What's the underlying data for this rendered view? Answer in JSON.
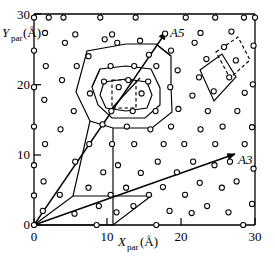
{
  "figure": {
    "title": "",
    "x_axis_label_main": "X",
    "x_axis_label_sub": "par",
    "x_axis_label_unit": "(Å)",
    "y_axis_label_main": "Y",
    "y_axis_label_sub": "par",
    "y_axis_label_unit": "(Å)",
    "origin_label": "0",
    "annotations": [
      {
        "name": "A5",
        "label": "A5"
      },
      {
        "name": "A3",
        "label": "A3"
      }
    ],
    "colors": {
      "line": "#000000",
      "marker_stroke": "#000000",
      "marker_fill": "#ffffff",
      "background": "#ffffff"
    }
  },
  "chart_data": {
    "type": "scatter",
    "title": "",
    "xlabel": "X_par (Å)",
    "ylabel": "Y_par (Å)",
    "xlim": [
      0,
      31.2
    ],
    "ylim": [
      0,
      31.6
    ],
    "grid": false,
    "legend": null,
    "xticks": [
      0,
      10,
      20,
      30
    ],
    "xticklabels": [
      "0",
      "10",
      "20",
      "30"
    ],
    "yticks": [
      0,
      10,
      20,
      30
    ],
    "yticklabels": [
      "0",
      "10",
      "20",
      "30"
    ],
    "marker": "open-circle",
    "points": [
      [
        0.0,
        0.0
      ],
      [
        0.0,
        4.2
      ],
      [
        0.0,
        8.5
      ],
      [
        0.0,
        14.0
      ],
      [
        0.0,
        19.6
      ],
      [
        0.0,
        24.8
      ],
      [
        0.0,
        29.5
      ],
      [
        1.2,
        2.0
      ],
      [
        1.3,
        6.2
      ],
      [
        1.5,
        11.5
      ],
      [
        1.4,
        17.8
      ],
      [
        1.6,
        22.6
      ],
      [
        1.5,
        27.3
      ],
      [
        2.0,
        29.5
      ],
      [
        3.5,
        4.3
      ],
      [
        3.6,
        13.6
      ],
      [
        3.8,
        20.6
      ],
      [
        4.0,
        29.5
      ],
      [
        4.2,
        25.9
      ],
      [
        5.5,
        1.6
      ],
      [
        5.6,
        9.0
      ],
      [
        5.4,
        16.2
      ],
      [
        5.8,
        22.6
      ],
      [
        5.6,
        27.1
      ],
      [
        7.4,
        5.3
      ],
      [
        7.5,
        11.5
      ],
      [
        7.6,
        18.7
      ],
      [
        7.4,
        24.0
      ],
      [
        8.5,
        0.0
      ],
      [
        8.8,
        2.7
      ],
      [
        9.0,
        29.5
      ],
      [
        9.4,
        7.5
      ],
      [
        9.3,
        14.3
      ],
      [
        9.5,
        20.4
      ],
      [
        9.6,
        26.4
      ],
      [
        10.4,
        4.3
      ],
      [
        10.6,
        11.5
      ],
      [
        10.5,
        16.2
      ],
      [
        10.4,
        22.6
      ],
      [
        10.6,
        27.1
      ],
      [
        11.2,
        1.8
      ],
      [
        11.4,
        8.5
      ],
      [
        11.5,
        19.6
      ],
      [
        11.3,
        25.9
      ],
      [
        12.5,
        5.3
      ],
      [
        12.6,
        14.0
      ],
      [
        12.8,
        20.6
      ],
      [
        13.5,
        2.7
      ],
      [
        13.6,
        11.5
      ],
      [
        13.4,
        16.2
      ],
      [
        13.6,
        22.6
      ],
      [
        13.8,
        29.5
      ],
      [
        14.5,
        7.4
      ],
      [
        14.6,
        18.7
      ],
      [
        14.4,
        26.2
      ],
      [
        15.6,
        4.3
      ],
      [
        15.8,
        13.6
      ],
      [
        15.5,
        20.4
      ],
      [
        15.6,
        24.2
      ],
      [
        16.6,
        0.0
      ],
      [
        16.8,
        9.0
      ],
      [
        16.5,
        16.2
      ],
      [
        16.6,
        22.6
      ],
      [
        17.5,
        5.4
      ],
      [
        17.6,
        11.5
      ],
      [
        17.8,
        27.2
      ],
      [
        18.4,
        2.0
      ],
      [
        18.6,
        14.0
      ],
      [
        18.5,
        19.6
      ],
      [
        18.6,
        24.8
      ],
      [
        19.4,
        7.5
      ],
      [
        19.6,
        16.5
      ],
      [
        19.5,
        22.0
      ],
      [
        20.5,
        4.3
      ],
      [
        20.4,
        11.5
      ],
      [
        20.6,
        29.5
      ],
      [
        21.4,
        1.7
      ],
      [
        21.6,
        9.0
      ],
      [
        21.5,
        18.4
      ],
      [
        21.8,
        25.9
      ],
      [
        22.5,
        6.0
      ],
      [
        22.6,
        13.6
      ],
      [
        22.4,
        21.0
      ],
      [
        22.6,
        27.3
      ],
      [
        23.5,
        2.7
      ],
      [
        23.6,
        16.2
      ],
      [
        23.4,
        23.6
      ],
      [
        24.5,
        8.5
      ],
      [
        24.6,
        11.5
      ],
      [
        24.4,
        19.0
      ],
      [
        24.6,
        29.5
      ],
      [
        25.5,
        5.3
      ],
      [
        25.6,
        14.0
      ],
      [
        25.8,
        25.3
      ],
      [
        26.4,
        1.8
      ],
      [
        26.6,
        9.0
      ],
      [
        26.5,
        21.0
      ],
      [
        26.8,
        27.5
      ],
      [
        27.5,
        6.2
      ],
      [
        27.6,
        16.2
      ],
      [
        27.4,
        23.4
      ],
      [
        28.4,
        0.0
      ],
      [
        28.6,
        11.5
      ],
      [
        28.6,
        18.8
      ],
      [
        28.5,
        29.5
      ],
      [
        29.6,
        3.0
      ],
      [
        29.8,
        8.0
      ],
      [
        29.6,
        13.9
      ],
      [
        29.7,
        20.0
      ],
      [
        29.8,
        25.5
      ],
      [
        30.0,
        29.5
      ]
    ],
    "shapes": [
      {
        "name": "outer-decagon",
        "style": "solid"
      },
      {
        "name": "middle-octagon",
        "style": "solid"
      },
      {
        "name": "inner-octagon",
        "style": "solid"
      },
      {
        "name": "inner-square",
        "style": "dashed"
      },
      {
        "name": "right-rhombus-solid",
        "style": "solid"
      },
      {
        "name": "right-rhombus-dashed",
        "style": "dashed"
      },
      {
        "name": "lower-left-parallelogram",
        "style": "solid"
      }
    ],
    "vectors": [
      {
        "name": "A5",
        "from": [
          0,
          0
        ],
        "to": [
          19.0,
          29.0
        ],
        "label": "A5"
      },
      {
        "name": "A3",
        "from": [
          0,
          0
        ],
        "to": [
          27.5,
          9.6
        ],
        "label": "A3"
      }
    ]
  }
}
